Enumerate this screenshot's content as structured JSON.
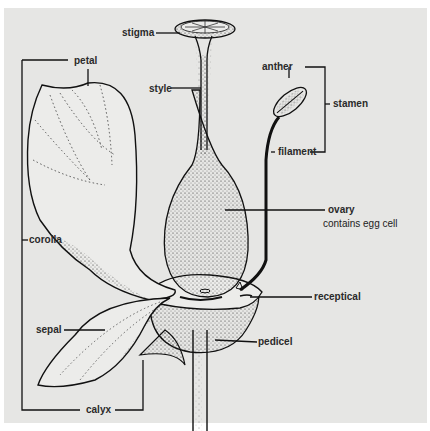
{
  "diagram": {
    "background_color": "#e6e6e4",
    "ink_color": "#1a1a1a",
    "labels": {
      "stigma": "stigma",
      "style": "style",
      "petal": "petal",
      "anther": "anther",
      "stamen": "stamen",
      "filament": "filament",
      "ovary": "ovary",
      "ovary_note": "contains egg cell",
      "corolla": "corolla",
      "receptical": "receptical",
      "sepal": "sepal",
      "pedicel": "pedicel",
      "calyx": "calyx"
    },
    "groups": [
      {
        "bracket": "stamen",
        "members": [
          "anther",
          "filament"
        ]
      },
      {
        "bracket": "corolla",
        "members": [
          "petal"
        ]
      },
      {
        "bracket": "calyx",
        "members": [
          "sepal"
        ]
      }
    ]
  }
}
